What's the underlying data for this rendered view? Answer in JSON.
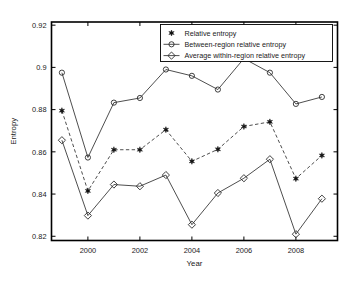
{
  "chart_data": {
    "type": "line",
    "title": "",
    "xlabel": "Year",
    "ylabel": "Entropy",
    "xlim": [
      1998.6,
      2009.6
    ],
    "ylim": [
      0.818,
      0.9215
    ],
    "grid": false,
    "legend_position": "top-right",
    "x": [
      1999,
      2000,
      2001,
      2002,
      2003,
      2004,
      2005,
      2006,
      2007,
      2008,
      2009
    ],
    "xticks": [
      2000,
      2002,
      2004,
      2006,
      2008
    ],
    "xtick_labels": [
      "2000",
      "2002",
      "2004",
      "2006",
      "2008"
    ],
    "yticks": [
      0.82,
      0.84,
      0.86,
      0.88,
      0.9,
      0.92
    ],
    "ytick_labels": [
      "0.82",
      "0.84",
      "0.86",
      "0.88",
      "0.9",
      "0.92"
    ],
    "series": [
      {
        "name": "Relative entropy",
        "marker": "star",
        "linestyle": "dashed",
        "values": [
          0.8795,
          0.8415,
          0.861,
          0.861,
          0.8705,
          0.8555,
          0.8612,
          0.872,
          0.8742,
          0.8473,
          0.8583
        ]
      },
      {
        "name": "Between-region relative entropy",
        "marker": "circle",
        "linestyle": "solid",
        "values": [
          0.8975,
          0.8573,
          0.8833,
          0.8855,
          0.899,
          0.896,
          0.8895,
          0.9042,
          0.8975,
          0.8827,
          0.886
        ]
      },
      {
        "name": "Average within-region relative entropy",
        "marker": "diamond",
        "linestyle": "solid",
        "values": [
          0.8655,
          0.8298,
          0.8445,
          0.8437,
          0.849,
          0.8255,
          0.8405,
          0.8475,
          0.8565,
          0.821,
          0.8378
        ]
      }
    ]
  },
  "legend": {
    "entries": [
      {
        "label": "Relative entropy",
        "marker": "star-marker-icon"
      },
      {
        "label": "Between-region relative entropy",
        "marker": "circle-marker-icon"
      },
      {
        "label": "Average within-region relative entropy",
        "marker": "diamond-marker-icon"
      }
    ]
  }
}
